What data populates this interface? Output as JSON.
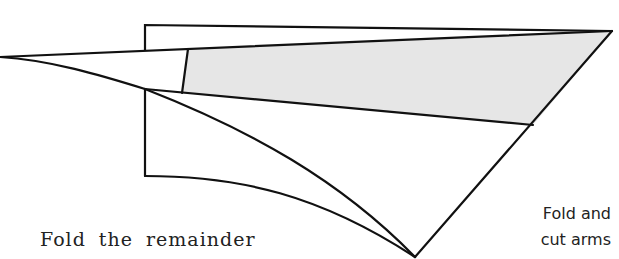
{
  "diagram": {
    "type": "folding-instruction",
    "colors": {
      "stroke": "#111111",
      "shade": "#e6e6e6",
      "background": "#ffffff"
    },
    "labels": {
      "instruction_left": "Fold the remainder",
      "instruction_right_line1": "Fold and",
      "instruction_right_line2": "cut arms"
    }
  }
}
